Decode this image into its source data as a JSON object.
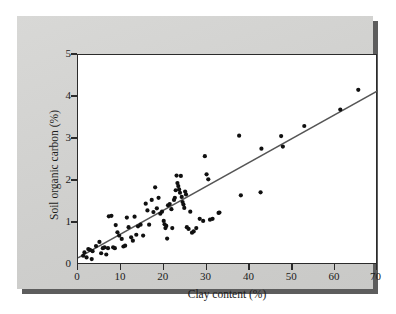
{
  "figure": {
    "background_color": "#d2d2d0",
    "plot_background_color": "#ffffff",
    "shadow_color": "#5d5d5d"
  },
  "chart_data": {
    "type": "scatter",
    "title": "",
    "xlabel": "Clay content (%)",
    "ylabel": "Soil organic carbon (%)",
    "xlim": [
      0,
      70
    ],
    "ylim": [
      0,
      5
    ],
    "xticks": [
      0,
      10,
      20,
      30,
      40,
      50,
      60,
      70
    ],
    "yticks": [
      0,
      1,
      2,
      3,
      4,
      5
    ],
    "grid": false,
    "legend": null,
    "point_color": "#101010",
    "line_color": "#555555",
    "trendline": {
      "type": "linear",
      "x": [
        0,
        70
      ],
      "y": [
        0.17,
        4.15
      ]
    },
    "points": [
      [
        1.2,
        0.22
      ],
      [
        1.5,
        0.3
      ],
      [
        2.0,
        0.18
      ],
      [
        2.4,
        0.38
      ],
      [
        2.8,
        0.36
      ],
      [
        3.2,
        0.14
      ],
      [
        3.4,
        0.33
      ],
      [
        4.2,
        0.45
      ],
      [
        5.0,
        0.55
      ],
      [
        5.4,
        0.28
      ],
      [
        5.8,
        0.4
      ],
      [
        6.2,
        0.42
      ],
      [
        6.6,
        0.25
      ],
      [
        7.0,
        0.4
      ],
      [
        7.2,
        1.16
      ],
      [
        7.8,
        1.17
      ],
      [
        8.2,
        0.42
      ],
      [
        8.6,
        0.4
      ],
      [
        8.8,
        0.95
      ],
      [
        9.2,
        0.78
      ],
      [
        9.6,
        0.7
      ],
      [
        10.2,
        0.62
      ],
      [
        10.6,
        0.44
      ],
      [
        11.0,
        0.46
      ],
      [
        11.4,
        1.13
      ],
      [
        11.8,
        0.9
      ],
      [
        12.4,
        0.66
      ],
      [
        12.8,
        0.58
      ],
      [
        13.2,
        1.15
      ],
      [
        13.6,
        0.72
      ],
      [
        14.0,
        0.92
      ],
      [
        14.6,
        0.96
      ],
      [
        15.2,
        0.7
      ],
      [
        15.8,
        1.46
      ],
      [
        16.2,
        1.3
      ],
      [
        16.6,
        0.96
      ],
      [
        17.2,
        1.55
      ],
      [
        17.6,
        1.26
      ],
      [
        18.0,
        1.85
      ],
      [
        18.4,
        1.35
      ],
      [
        18.8,
        1.6
      ],
      [
        19.2,
        1.22
      ],
      [
        19.6,
        1.27
      ],
      [
        20.0,
        1.05
      ],
      [
        20.2,
        0.97
      ],
      [
        20.4,
        0.88
      ],
      [
        20.6,
        0.93
      ],
      [
        20.8,
        0.63
      ],
      [
        21.0,
        1.42
      ],
      [
        21.4,
        1.45
      ],
      [
        21.8,
        1.33
      ],
      [
        22.0,
        0.88
      ],
      [
        22.4,
        1.55
      ],
      [
        22.6,
        1.6
      ],
      [
        22.8,
        1.78
      ],
      [
        23.0,
        2.13
      ],
      [
        23.2,
        1.95
      ],
      [
        23.4,
        1.88
      ],
      [
        23.6,
        1.8
      ],
      [
        23.8,
        1.72
      ],
      [
        24.0,
        2.12
      ],
      [
        24.2,
        1.62
      ],
      [
        24.4,
        1.5
      ],
      [
        24.6,
        1.44
      ],
      [
        24.8,
        1.36
      ],
      [
        25.0,
        1.75
      ],
      [
        25.2,
        1.68
      ],
      [
        25.4,
        0.9
      ],
      [
        25.8,
        0.86
      ],
      [
        26.2,
        1.27
      ],
      [
        26.6,
        0.77
      ],
      [
        27.0,
        0.8
      ],
      [
        27.6,
        0.88
      ],
      [
        28.4,
        1.1
      ],
      [
        29.2,
        1.05
      ],
      [
        29.6,
        2.59
      ],
      [
        30.0,
        2.16
      ],
      [
        30.4,
        2.04
      ],
      [
        30.8,
        1.08
      ],
      [
        31.4,
        1.1
      ],
      [
        32.8,
        1.24
      ],
      [
        33.0,
        1.25
      ],
      [
        37.6,
        3.08
      ],
      [
        38.0,
        1.66
      ],
      [
        42.6,
        1.73
      ],
      [
        42.8,
        2.77
      ],
      [
        47.4,
        3.07
      ],
      [
        47.8,
        2.82
      ],
      [
        52.8,
        3.31
      ],
      [
        61.2,
        3.7
      ],
      [
        65.4,
        4.17
      ]
    ]
  }
}
